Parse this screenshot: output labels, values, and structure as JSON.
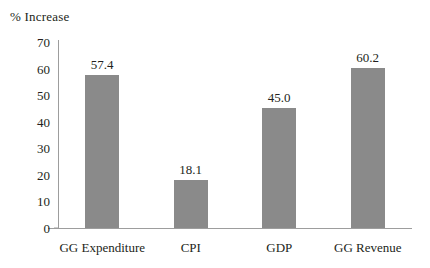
{
  "chart_data": {
    "type": "bar",
    "title": "",
    "ylabel": "% Increase",
    "xlabel": "",
    "categories": [
      "GG Expenditure",
      "CPI",
      "GDP",
      "GG Revenue"
    ],
    "values": [
      57.4,
      18.1,
      45.0,
      60.2
    ],
    "value_labels": [
      "57.4",
      "18.1",
      "45.0",
      "60.2"
    ],
    "ylim": [
      0,
      70
    ],
    "yticks": [
      0,
      10,
      20,
      30,
      40,
      50,
      60,
      70
    ],
    "ytick_labels": [
      "0",
      "10",
      "20",
      "30",
      "40",
      "50",
      "60",
      "70"
    ],
    "grid": false,
    "legend": false,
    "bar_color": "#8a8a8a",
    "axis_color": "#9d9d9d",
    "text_color": "#231f20",
    "background": "#ffffff"
  }
}
